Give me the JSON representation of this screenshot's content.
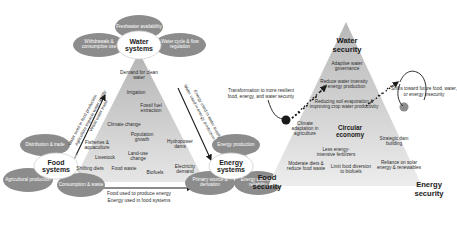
{
  "figure": {
    "panels": [
      "nexus-systems-triangle",
      "nexus-security-triangle"
    ]
  },
  "left_panel": {
    "apex_node": {
      "label": "Water systems",
      "satellites": [
        {
          "name": "freshwater-availability",
          "label": "Freshwater availability"
        },
        {
          "name": "withdrawals-consumptive-use",
          "label": "Withdrawals & consumptive use"
        },
        {
          "name": "water-cycle-flow-regulation",
          "label": "Water cycle & flow regulation"
        }
      ]
    },
    "left_node": {
      "label": "Food systems",
      "satellites": [
        {
          "name": "distribution-trade",
          "label": "Distribution & trade"
        },
        {
          "name": "agricultural-production",
          "label": "Agricultural production"
        },
        {
          "name": "consumption-waste",
          "label": "Consumption & waste"
        }
      ]
    },
    "right_node": {
      "label": "Energy systems",
      "satellites": [
        {
          "name": "energy-production",
          "label": "Energy production"
        },
        {
          "name": "primary-source-derivation",
          "label": "Primary source & derivation"
        },
        {
          "name": "energy-access-reliability",
          "label": "Energy access & reliability"
        }
      ]
    },
    "interior_items": [
      {
        "name": "demand-for-clean-water",
        "label": "Demand for clean water"
      },
      {
        "name": "irrigation",
        "label": "Irrigation"
      },
      {
        "name": "fossil-fuel-extraction",
        "label": "Fossil fuel extraction"
      },
      {
        "name": "climate-change",
        "label": "Climate change"
      },
      {
        "name": "population-growth",
        "label": "Population growth"
      },
      {
        "name": "hydropower-dams",
        "label": "Hydropower dams"
      },
      {
        "name": "fisheries-aquaculture",
        "label": "Fisheries & aquaculture"
      },
      {
        "name": "land-use-change",
        "label": "Land-use change"
      },
      {
        "name": "livestock",
        "label": "Livestock"
      },
      {
        "name": "electricity-demand",
        "label": "Electricity demand"
      },
      {
        "name": "shifting-diets",
        "label": "Shifting diets"
      },
      {
        "name": "food-waste",
        "label": "Food waste"
      },
      {
        "name": "biofuels",
        "label": "Biofuels"
      }
    ],
    "edge_labels": {
      "left_edge": [
        "Water used in food production",
        "Agriculture impacts water quality",
        "Virtual water trade"
      ],
      "right_edge": [
        "Water used in energy production",
        "Energy used in water supply"
      ],
      "bottom_edge": [
        "Food used to produce energy",
        "Energy used in food systems"
      ]
    }
  },
  "right_panel": {
    "corner_labels": {
      "top": "Water security",
      "left": "Food security",
      "right": "Energy security"
    },
    "annotations": [
      {
        "name": "transformation-annotation",
        "label": "Transformation to more resilient food, energy, and water security"
      },
      {
        "name": "insecurity-annotation",
        "label": "Shifts toward future food, water, or energy insecurity"
      }
    ],
    "interior_items": [
      {
        "name": "adaptive-water-governance",
        "label": "Adaptive water governance"
      },
      {
        "name": "reduce-water-intensity-energy",
        "label": "Reduce water intensity of energy production"
      },
      {
        "name": "reducing-soil-evaporation",
        "label": "Reducing soil evaporation & improving crop water productivity"
      },
      {
        "name": "climate-adaptation-agriculture",
        "label": "Climate adaptation in agriculture"
      },
      {
        "name": "circular-economy",
        "label": "Circular economy"
      },
      {
        "name": "strategic-dam-building",
        "label": "Strategic dam building"
      },
      {
        "name": "less-energy-intensive-fertilizers",
        "label": "Less energy-intensive fertilizers"
      },
      {
        "name": "moderate-diets-reduce-waste",
        "label": "Moderate diets & reduce food waste"
      },
      {
        "name": "limit-food-diversion-biofuels",
        "label": "Limit food diversion to biofuels"
      },
      {
        "name": "reliance-solar-renewables",
        "label": "Reliance on solar energy & renewables"
      }
    ]
  },
  "colors": {
    "node_fill": "#8c8c8c",
    "hub_fill": "#ffffff",
    "triangle_top": "#bdbdbd",
    "triangle_bottom": "#e2e2e2",
    "text_dark": "#2b2b2b",
    "text_light": "#ffffff",
    "marker": "#1a1a1a"
  }
}
